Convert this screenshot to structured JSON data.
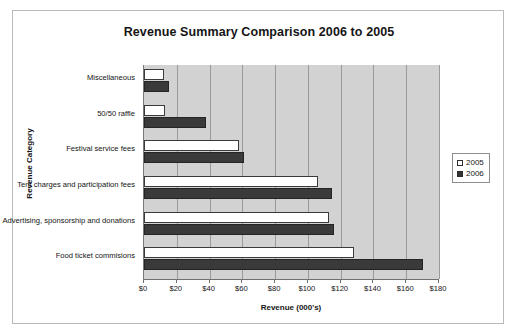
{
  "chart_data": {
    "type": "bar",
    "orientation": "horizontal",
    "title": "Revenue Summary Comparison 2006 to 2005",
    "xlabel": "Revenue (000's)",
    "ylabel": "Revenue Category",
    "categories": [
      "Miscellaneous",
      "50/50 raffle",
      "Festival service fees",
      "Tent charges and participation fees",
      "Advertising, sponsorship and donations",
      "Food ticket commisions"
    ],
    "series": [
      {
        "name": "2005",
        "color": "#ffffff",
        "values": [
          12,
          13,
          58,
          106,
          113,
          128
        ]
      },
      {
        "name": "2006",
        "color": "#333333",
        "values": [
          15,
          38,
          61,
          115,
          116,
          170
        ]
      }
    ],
    "xlim": [
      0,
      180
    ],
    "xticks": [
      0,
      20,
      40,
      60,
      80,
      100,
      120,
      140,
      160,
      180
    ],
    "xtick_labels": [
      "$0",
      "$20",
      "$40",
      "$60",
      "$80",
      "$100",
      "$120",
      "$140",
      "$160",
      "$180"
    ],
    "grid": "vertical",
    "legend_position": "right",
    "plot_background": "#d2d2d2"
  },
  "legend": {
    "entries": [
      {
        "label": "2005"
      },
      {
        "label": "2006"
      }
    ]
  }
}
